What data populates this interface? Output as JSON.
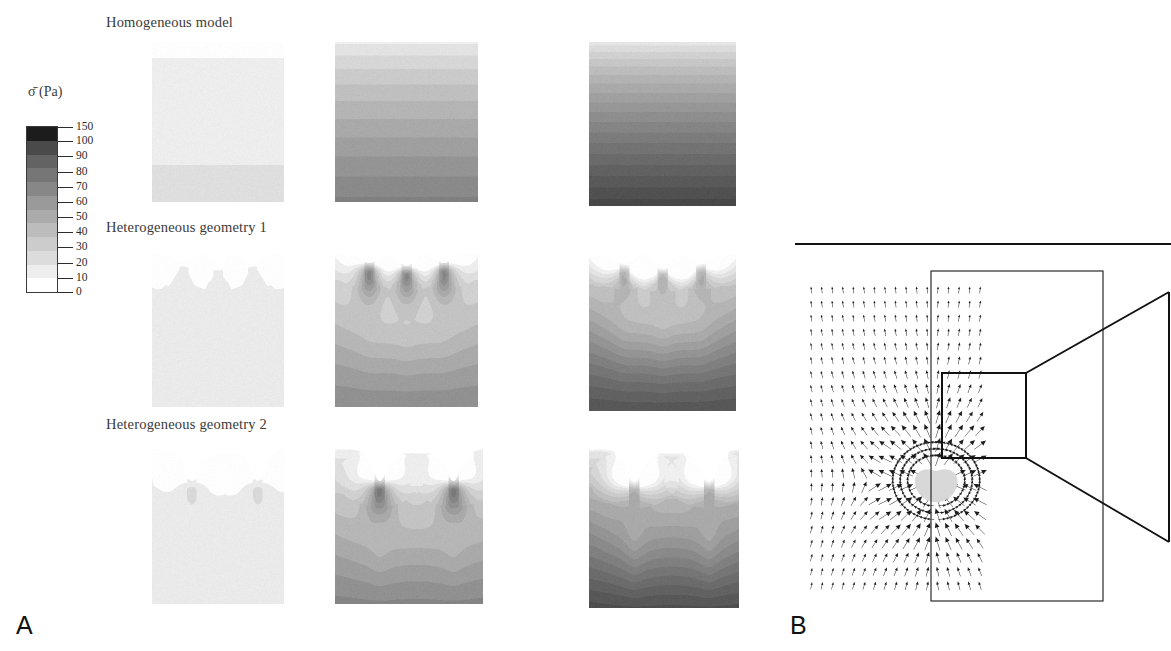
{
  "figure": {
    "panel_a_letter": "A",
    "panel_b_letter": "B"
  },
  "colorbar": {
    "title": "σ̄ (Pa)",
    "unit": "Pa",
    "symbol": "sigma-bar",
    "ticks": [
      150,
      100,
      90,
      80,
      70,
      60,
      50,
      40,
      30,
      20,
      10,
      0
    ],
    "min": 0,
    "max": 150,
    "colors": [
      "#1c1c1c",
      "#4a4a4a",
      "#636363",
      "#767676",
      "#878787",
      "#9a9a9a",
      "#ababab",
      "#bcbcbc",
      "#cccccc",
      "#dcdcdc",
      "#eeeeee",
      "#ffffff"
    ]
  },
  "rows": [
    {
      "label": "Homogeneous model"
    },
    {
      "label": "Heterogeneous geometry 1"
    },
    {
      "label": "Heterogeneous geometry 2"
    }
  ],
  "chart_data": {
    "type": "heatmap",
    "title": "",
    "xlabel": "",
    "ylabel": "",
    "colorbar_label": "σ̄ (Pa)",
    "value_range": [
      0,
      150
    ],
    "grid": false,
    "legend_position": "left",
    "row_labels": [
      "Homogeneous model",
      "Heterogeneous geometry 1",
      "Heterogeneous geometry 2"
    ],
    "column_load_levels": [
      1,
      2,
      3
    ],
    "panels": [
      {
        "row": "Homogeneous model",
        "column": 1,
        "geometry": "flat",
        "notch_count": 0,
        "surface_depth": 0,
        "top_value": 2,
        "bottom_value": 14,
        "peak_value": 14,
        "bands": [
          2,
          4,
          8,
          11,
          13,
          14
        ]
      },
      {
        "row": "Homogeneous model",
        "column": 2,
        "geometry": "flat",
        "notch_count": 0,
        "surface_depth": 0,
        "top_value": 8,
        "bottom_value": 72,
        "peak_value": 72,
        "bands": [
          8,
          20,
          32,
          45,
          58,
          66,
          72
        ]
      },
      {
        "row": "Homogeneous model",
        "column": 3,
        "geometry": "flat",
        "notch_count": 0,
        "surface_depth": 0,
        "top_value": 10,
        "bottom_value": 112,
        "peak_value": 112,
        "bands": [
          10,
          26,
          42,
          58,
          72,
          86,
          98,
          112
        ]
      },
      {
        "row": "Heterogeneous geometry 1",
        "column": 1,
        "geometry": "shallow-notches",
        "notch_count": 3,
        "surface_depth": 22,
        "top_value": 2,
        "bottom_value": 13,
        "peak_value": 22,
        "bands": [
          2,
          5,
          8,
          11,
          13
        ]
      },
      {
        "row": "Heterogeneous geometry 1",
        "column": 2,
        "geometry": "shallow-notches",
        "notch_count": 3,
        "surface_depth": 22,
        "top_value": 8,
        "bottom_value": 66,
        "peak_value": 140,
        "bands": [
          8,
          22,
          38,
          52,
          60,
          66
        ]
      },
      {
        "row": "Heterogeneous geometry 1",
        "column": 3,
        "geometry": "shallow-notches",
        "notch_count": 3,
        "surface_depth": 22,
        "top_value": 10,
        "bottom_value": 104,
        "peak_value": 150,
        "bands": [
          10,
          28,
          46,
          62,
          80,
          94,
          104
        ]
      },
      {
        "row": "Heterogeneous geometry 2",
        "column": 1,
        "geometry": "deep-notches",
        "notch_count": 2,
        "surface_depth": 62,
        "top_value": 2,
        "bottom_value": 13,
        "peak_value": 30,
        "bands": [
          2,
          5,
          8,
          11,
          13
        ]
      },
      {
        "row": "Heterogeneous geometry 2",
        "column": 2,
        "geometry": "deep-notches",
        "notch_count": 2,
        "surface_depth": 62,
        "top_value": 6,
        "bottom_value": 70,
        "peak_value": 150,
        "bands": [
          6,
          20,
          36,
          52,
          64,
          70
        ]
      },
      {
        "row": "Heterogeneous geometry 2",
        "column": 3,
        "geometry": "deep-notches",
        "notch_count": 2,
        "surface_depth": 62,
        "top_value": 8,
        "bottom_value": 108,
        "peak_value": 150,
        "bands": [
          8,
          28,
          48,
          68,
          86,
          100,
          108
        ]
      }
    ],
    "panel_b": {
      "type": "quiver",
      "description": "displacement vector field around an inclusion",
      "arrow_rows": 22,
      "arrow_cols": 17,
      "inclusion_shape": "teardrop",
      "has_zoom_callout": true,
      "flow_direction": "vertical"
    }
  }
}
